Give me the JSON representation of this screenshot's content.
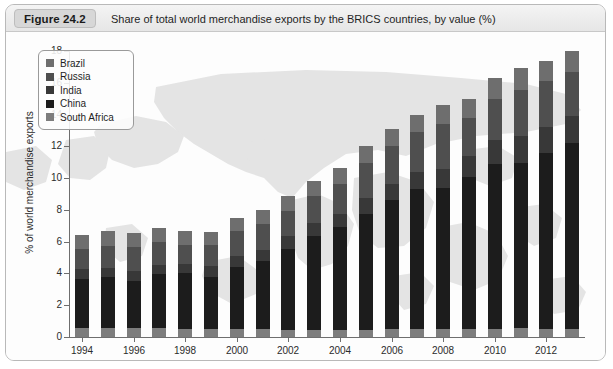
{
  "figure": {
    "number_label": "Figure 24.2",
    "caption": "Share of total world merchandise exports by the BRICS countries, by value (%)"
  },
  "chart_data": {
    "type": "bar",
    "stacked": true,
    "title": "Share of total world merchandise exports by the BRICS countries, by value (%)",
    "xlabel": "",
    "ylabel": "% of world merchandise exports",
    "ylim": [
      0,
      18
    ],
    "ytick_step": 2,
    "yticks": [
      0,
      2,
      4,
      6,
      8,
      10,
      12,
      14,
      16,
      18
    ],
    "grid": false,
    "legend_position": "top-left",
    "categories": [
      "1994",
      "1995",
      "1996",
      "1997",
      "1998",
      "1999",
      "2000",
      "2001",
      "2002",
      "2003",
      "2004",
      "2005",
      "2006",
      "2007",
      "2008",
      "2009",
      "2010",
      "2011",
      "2012",
      "2013"
    ],
    "xtick_labels": [
      "1994",
      "1996",
      "1998",
      "2000",
      "2002",
      "2004",
      "2006",
      "2008",
      "2010",
      "2012"
    ],
    "stack_order_bottom_to_top": [
      "South Africa",
      "China",
      "India",
      "Russia",
      "Brazil"
    ],
    "series": [
      {
        "name": "Brazil",
        "color": "#6e6e6e",
        "values": [
          0.9,
          0.9,
          0.9,
          0.9,
          0.9,
          0.8,
          0.8,
          0.9,
          0.9,
          1.0,
          1.0,
          1.1,
          1.1,
          1.1,
          1.2,
          1.2,
          1.3,
          1.4,
          1.3,
          1.3
        ]
      },
      {
        "name": "Russia",
        "color": "#4f4f4f",
        "values": [
          1.3,
          1.4,
          1.5,
          1.4,
          1.2,
          1.3,
          1.6,
          1.6,
          1.6,
          1.7,
          1.9,
          2.2,
          2.4,
          2.5,
          2.8,
          2.4,
          2.6,
          2.9,
          2.9,
          2.8
        ]
      },
      {
        "name": "India",
        "color": "#383838",
        "values": [
          0.6,
          0.6,
          0.6,
          0.6,
          0.6,
          0.7,
          0.7,
          0.7,
          0.8,
          0.8,
          0.8,
          1.0,
          1.0,
          1.1,
          1.2,
          1.3,
          1.5,
          1.7,
          1.6,
          1.7
        ]
      },
      {
        "name": "China",
        "color": "#1c1c1c",
        "values": [
          3.1,
          3.2,
          3.0,
          3.4,
          3.5,
          3.3,
          3.9,
          4.3,
          5.1,
          5.9,
          6.5,
          7.3,
          8.1,
          8.8,
          8.9,
          9.6,
          10.4,
          10.4,
          11.1,
          11.7
        ]
      },
      {
        "name": "South Africa",
        "color": "#7d7d7d",
        "values": [
          0.55,
          0.55,
          0.55,
          0.55,
          0.5,
          0.5,
          0.5,
          0.5,
          0.45,
          0.45,
          0.45,
          0.45,
          0.5,
          0.5,
          0.5,
          0.5,
          0.5,
          0.55,
          0.5,
          0.5
        ]
      }
    ],
    "totals": [
      6.45,
      6.65,
      6.55,
      6.85,
      6.7,
      6.6,
      7.5,
      8.0,
      8.85,
      9.85,
      10.65,
      12.05,
      13.1,
      14.0,
      14.6,
      15.0,
      16.3,
      16.95,
      17.4,
      18.0
    ],
    "axis_colors": {
      "axis_line": "#6e6e6e",
      "tick_label": "#2b2b2b",
      "background": "#fdfdfd",
      "watermark": "#e3e3e3"
    }
  },
  "legend": {
    "items": [
      {
        "label": "Brazil",
        "color": "#6e6e6e"
      },
      {
        "label": "Russia",
        "color": "#4f4f4f"
      },
      {
        "label": "India",
        "color": "#383838"
      },
      {
        "label": "China",
        "color": "#1c1c1c"
      },
      {
        "label": "South Africa",
        "color": "#7d7d7d"
      }
    ]
  }
}
